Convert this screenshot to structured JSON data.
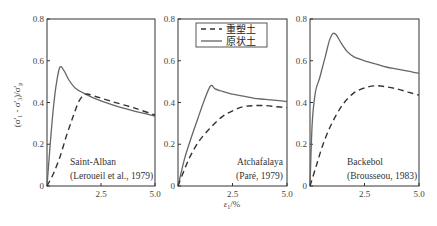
{
  "chart_data": [
    {
      "type": "line",
      "panel": "Saint-Alban",
      "annotation": [
        "Saint-Alban",
        "(Leroueil et al., 1979)"
      ],
      "xlabel": "",
      "ylabel": "(σ'1 - σ'3)/σ'p",
      "xlim": [
        0,
        5.0
      ],
      "ylim": [
        0,
        0.8
      ],
      "xticks": [
        "2.5",
        "5.0"
      ],
      "yticks": [
        "0",
        "0.2",
        "0.4",
        "0.6",
        "0.8"
      ],
      "series": [
        {
          "name": "原状土",
          "style": "solid",
          "x": [
            0,
            0.15,
            0.3,
            0.45,
            0.6,
            0.8,
            1.0,
            1.3,
            1.7,
            2.2,
            3.0,
            4.0,
            5.0
          ],
          "y": [
            0,
            0.2,
            0.38,
            0.5,
            0.57,
            0.55,
            0.51,
            0.47,
            0.445,
            0.42,
            0.39,
            0.36,
            0.335
          ]
        },
        {
          "name": "重塑土",
          "style": "dashed",
          "x": [
            0,
            0.3,
            0.6,
            0.9,
            1.2,
            1.5,
            1.8,
            2.2,
            3.0,
            4.0,
            5.0
          ],
          "y": [
            0,
            0.06,
            0.14,
            0.24,
            0.33,
            0.41,
            0.44,
            0.43,
            0.405,
            0.375,
            0.34
          ]
        }
      ]
    },
    {
      "type": "line",
      "panel": "Atchafalaya",
      "annotation": [
        "Atchafalaya",
        "(Paré, 1979)"
      ],
      "xlabel": "ε1/%",
      "ylabel": "",
      "xlim": [
        0,
        5.0
      ],
      "ylim": [
        0,
        0.8
      ],
      "xticks": [
        "2.5",
        "5.0"
      ],
      "yticks": [
        "0",
        "0.2",
        "0.4",
        "0.6",
        "0.8"
      ],
      "series": [
        {
          "name": "原状土",
          "style": "solid",
          "x": [
            0,
            0.3,
            0.6,
            0.9,
            1.2,
            1.5,
            1.7,
            2.0,
            2.5,
            3.0,
            3.5,
            4.0,
            4.5,
            5.0
          ],
          "y": [
            0,
            0.13,
            0.23,
            0.32,
            0.41,
            0.48,
            0.465,
            0.455,
            0.44,
            0.43,
            0.42,
            0.415,
            0.41,
            0.405
          ]
        },
        {
          "name": "重塑土",
          "style": "dashed",
          "x": [
            0,
            0.3,
            0.6,
            1.0,
            1.5,
            2.0,
            2.5,
            3.0,
            3.5,
            4.0,
            4.5,
            5.0
          ],
          "y": [
            0,
            0.08,
            0.15,
            0.22,
            0.28,
            0.33,
            0.36,
            0.38,
            0.385,
            0.385,
            0.38,
            0.375
          ]
        }
      ]
    },
    {
      "type": "line",
      "panel": "Backebol",
      "annotation": [
        "Backebol",
        "(Brousseou, 1983)"
      ],
      "xlabel": "",
      "ylabel": "",
      "xlim": [
        0,
        5.0
      ],
      "ylim": [
        0,
        0.8
      ],
      "xticks": [
        "2.5",
        "5.0"
      ],
      "yticks": [
        "0",
        "0.2",
        "0.4",
        "0.6",
        "0.8"
      ],
      "series": [
        {
          "name": "原状土",
          "style": "solid",
          "x": [
            0,
            0.1,
            0.25,
            0.45,
            0.7,
            0.9,
            1.05,
            1.2,
            1.4,
            1.7,
            2.0,
            2.5,
            3.0,
            3.5,
            4.0,
            4.5,
            5.0
          ],
          "y": [
            0,
            0.3,
            0.45,
            0.52,
            0.62,
            0.7,
            0.73,
            0.725,
            0.69,
            0.645,
            0.62,
            0.6,
            0.585,
            0.57,
            0.56,
            0.55,
            0.54
          ]
        },
        {
          "name": "重塑土",
          "style": "dashed",
          "x": [
            0,
            0.3,
            0.6,
            1.0,
            1.5,
            2.0,
            2.5,
            3.0,
            3.5,
            4.0,
            4.5,
            5.0
          ],
          "y": [
            0,
            0.1,
            0.2,
            0.3,
            0.39,
            0.445,
            0.47,
            0.48,
            0.475,
            0.465,
            0.45,
            0.435
          ]
        }
      ]
    }
  ],
  "legend": {
    "items": [
      {
        "label": "重塑土",
        "style": "dashed"
      },
      {
        "label": "原状土",
        "style": "solid"
      }
    ]
  },
  "axes": {
    "ylabel": "(σ'1 - σ'3)/σ'p",
    "xlabel": "ε1/%"
  }
}
